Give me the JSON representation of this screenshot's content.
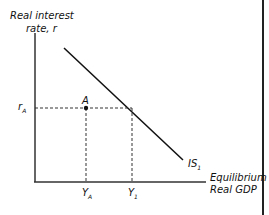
{
  "diagram": {
    "y_axis_label_line1": "Real interest",
    "y_axis_label_line2": "rate, r",
    "x_axis_label_line1": "Equilibrium",
    "x_axis_label_line2": "Real GDP",
    "curve_label": "IS",
    "curve_label_sub": "1",
    "point_label": "A",
    "r_tick": "r",
    "r_tick_sub": "A",
    "y_tick_a": "Y",
    "y_tick_a_sub": "A",
    "y_tick_1": "Y",
    "y_tick_1_sub": "1"
  }
}
